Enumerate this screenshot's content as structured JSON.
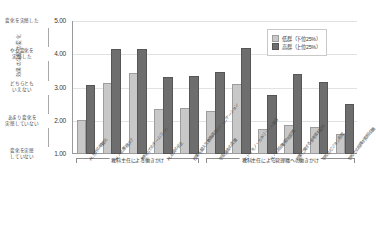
{
  "chart_data": {
    "type": "bar",
    "title": "",
    "xlabel": "",
    "ylabel": "効果の実感の変化",
    "ylim": [
      1.0,
      5.0
    ],
    "yticks": [
      "1.00",
      "2.00",
      "3.00",
      "4.00",
      "5.00"
    ],
    "ytick_descriptors": [
      "変化を実感した",
      "やや変化を\n実感した",
      "どちらとも\nいえない",
      "あまり変化を\n実感していない",
      "変化を実感\nしていない"
    ],
    "grid": true,
    "legend_position": "top-right",
    "categories": [
      "AL方針の明確化",
      "ALへの意欲づけ",
      "教科内でのチームづくり",
      "ALの質の向上",
      "授業を超えた教職員間コミュニケーション",
      "学習機会の支援",
      "ヒト・モノ・カネリソース獲得",
      "ALへの組織的取組促進",
      "授業に関する参考資料配布",
      "学校のビジョン形成",
      "学校での組織的取組促進"
    ],
    "series": [
      {
        "name": "低群（下位25%）",
        "color": "#c8c8c8",
        "values": [
          1.97,
          3.08,
          3.37,
          2.28,
          2.33,
          2.23,
          3.05,
          1.68,
          1.8,
          1.75,
          1.55
        ]
      },
      {
        "name": "高群（上位25%）",
        "color": "#6e6e6e",
        "values": [
          3.02,
          4.1,
          4.1,
          3.25,
          3.28,
          3.42,
          4.12,
          2.72,
          3.35,
          3.1,
          2.43
        ]
      }
    ],
    "groups": [
      {
        "label": "教科主任による働きかけ",
        "start": 0,
        "end": 4
      },
      {
        "label": "教科主任による管理職への働きかけ",
        "start": 5,
        "end": 10
      }
    ]
  },
  "legend": {
    "items": [
      {
        "label": "低群（下位25%）"
      },
      {
        "label": "高群（上位25%）"
      }
    ]
  }
}
